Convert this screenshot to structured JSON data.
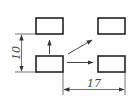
{
  "diagram": {
    "title": "",
    "boxes": [
      {
        "id": "top-left",
        "x": 36,
        "y": 18,
        "w": 27,
        "h": 16
      },
      {
        "id": "bottom-left",
        "x": 36,
        "y": 56,
        "w": 27,
        "h": 16
      },
      {
        "id": "top-right",
        "x": 98,
        "y": 18,
        "w": 27,
        "h": 16
      },
      {
        "id": "bottom-right",
        "x": 98,
        "y": 56,
        "w": 27,
        "h": 16
      }
    ],
    "arrows": [
      {
        "id": "up",
        "from": "bottom-left",
        "direction": "up"
      },
      {
        "id": "diagonal",
        "from": "bottom-left",
        "direction": "up-right"
      },
      {
        "id": "right",
        "from": "bottom-left",
        "direction": "right"
      }
    ],
    "dimensions": {
      "vertical": {
        "value": "10",
        "between": [
          "top-left.bottom",
          "bottom-left.bottom"
        ]
      },
      "horizontal": {
        "value": "17",
        "between": [
          "bottom-left.right",
          "bottom-right.right"
        ]
      }
    },
    "colors": {
      "stroke": "#222222",
      "background": "#ffffff"
    }
  }
}
